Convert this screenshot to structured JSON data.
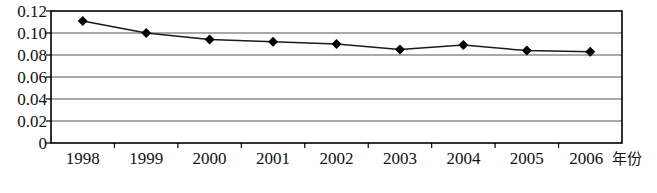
{
  "chart_data": {
    "type": "line",
    "title": "",
    "subtitle": "",
    "xlabel": "年份",
    "ylabel": "",
    "categories": [
      "1998",
      "1999",
      "2000",
      "2001",
      "2002",
      "2003",
      "2004",
      "2005",
      "2006"
    ],
    "series": [
      {
        "name": "",
        "values": [
          0.111,
          0.1,
          0.094,
          0.092,
          0.09,
          0.085,
          0.089,
          0.084,
          0.083
        ]
      }
    ],
    "ylim": [
      0,
      0.12
    ],
    "ytick_values": [
      0.12,
      0.1,
      0.08,
      0.06,
      0.04,
      0.02,
      0
    ],
    "ytick_labels": [
      "0.12",
      "0.10",
      "0.08",
      "0.06",
      "0.04",
      "0.02",
      "0"
    ],
    "grid": true,
    "grid_axis": "y",
    "legend": false,
    "legend_position": "none",
    "marker": "diamond",
    "marker_color": "#000000",
    "line_color": "#1a1a1a",
    "plot_border_color": "#000000",
    "grid_color": "#555555",
    "background_color": "#ffffff"
  },
  "axis": {
    "x_title": "年份"
  }
}
